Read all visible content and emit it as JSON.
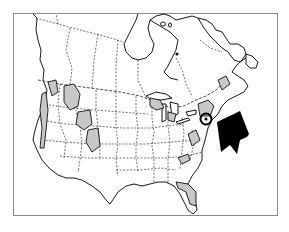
{
  "map": {
    "region": "North America",
    "style": "black-and-white outline range map",
    "colors": {
      "background": "#ffffff",
      "frame": "#8a8a8a",
      "outline": "#1a1a1a",
      "range_fill": "#c8c8c8",
      "marker": "#000000"
    },
    "shaded_ranges": [
      {
        "name": "pacific-northwest-coast"
      },
      {
        "name": "idaho-montana-rockies"
      },
      {
        "name": "wyoming-rockies"
      },
      {
        "name": "colorado-rockies"
      },
      {
        "name": "sierra-nevada"
      },
      {
        "name": "great-lakes-region"
      },
      {
        "name": "new-england-new-york"
      },
      {
        "name": "maritime-canada"
      },
      {
        "name": "appalachians"
      },
      {
        "name": "southern-appalachians"
      },
      {
        "name": "florida-gulf-coast"
      }
    ],
    "marker": {
      "type": "circle",
      "location": "southern New England / New York"
    },
    "arrow": {
      "type": "large black arrow",
      "direction": "pointing up-left toward marker"
    }
  }
}
